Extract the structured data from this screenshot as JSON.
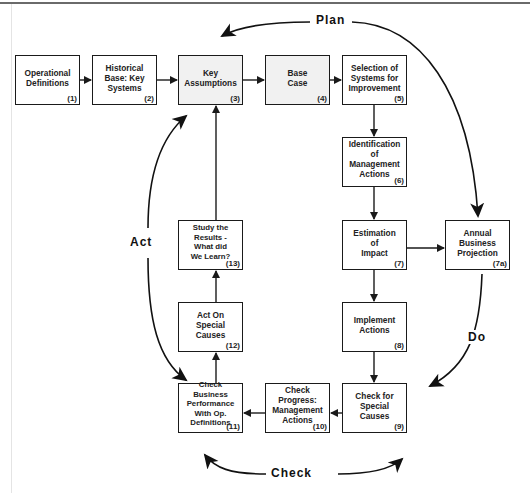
{
  "diagram": {
    "phases": {
      "plan": "Plan",
      "do": "Do",
      "check": "Check",
      "act": "Act"
    },
    "boxes": [
      {
        "id": "1",
        "label": "Operational\nDefinitions",
        "number": "(1)"
      },
      {
        "id": "2",
        "label": "Historical\nBase: Key\nSystems",
        "number": "(2)"
      },
      {
        "id": "3",
        "label": "Key\nAssumptions",
        "number": "(3)"
      },
      {
        "id": "4",
        "label": "Base\nCase",
        "number": "(4)"
      },
      {
        "id": "5",
        "label": "Selection of\nSystems for\nImprovement",
        "number": "(5)"
      },
      {
        "id": "6",
        "label": "Identification\nof Management\nActions",
        "number": "(6)"
      },
      {
        "id": "7",
        "label": "Estimation\nof\nImpact",
        "number": "(7)"
      },
      {
        "id": "7a",
        "label": "Annual\nBusiness\nProjection",
        "number": "(7a)"
      },
      {
        "id": "8",
        "label": "Implement\nActions",
        "number": "(8)"
      },
      {
        "id": "9",
        "label": "Check for\nSpecial\nCauses",
        "number": "(9)"
      },
      {
        "id": "10",
        "label": "Check Progress:\nManagement\nActions",
        "number": "(10)"
      },
      {
        "id": "11",
        "label": "Check Business\nPerformance\nWith Op.\nDefinitions",
        "number": "(11)"
      },
      {
        "id": "12",
        "label": "Act On\nSpecial\nCauses",
        "number": "(12)"
      },
      {
        "id": "13",
        "label": "Study the\nResults -\nWhat did\nWe Learn?",
        "number": "(13)"
      }
    ],
    "edges": [
      [
        "1",
        "2"
      ],
      [
        "2",
        "3"
      ],
      [
        "3",
        "4"
      ],
      [
        "4",
        "5"
      ],
      [
        "5",
        "6"
      ],
      [
        "6",
        "7"
      ],
      [
        "7",
        "7a"
      ],
      [
        "7",
        "8"
      ],
      [
        "8",
        "9"
      ],
      [
        "9",
        "10"
      ],
      [
        "10",
        "11"
      ],
      [
        "11",
        "12"
      ],
      [
        "12",
        "13"
      ],
      [
        "13",
        "3"
      ]
    ],
    "colors": {
      "line": "#1a1a1a",
      "shaded_box": "#f1f1f1"
    }
  }
}
